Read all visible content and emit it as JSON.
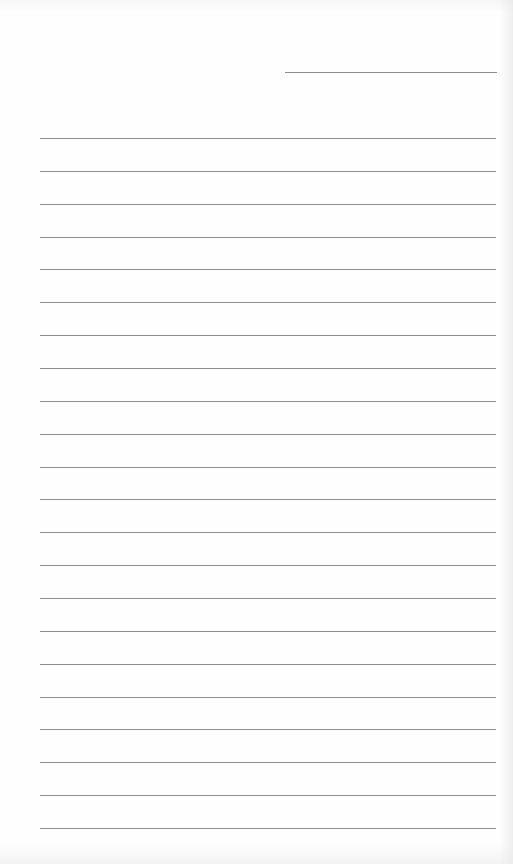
{
  "document": {
    "type": "lined-paper",
    "background_color": "#fefefe",
    "line_color": "#8f8f8f"
  },
  "header_line": {
    "x": 285,
    "y": 72,
    "width": 212
  },
  "ruled_lines": {
    "x": 40,
    "width": 456,
    "start_y": 138,
    "spacing": 32.86,
    "count": 22
  }
}
